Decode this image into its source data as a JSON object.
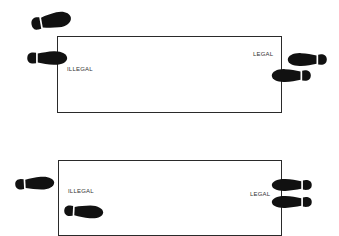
{
  "diagrams": [
    {
      "box": {
        "left": 57,
        "top": 36,
        "width": 225,
        "height": 77
      },
      "labels": {
        "illegal": {
          "text": "ILLEGAL",
          "x": 67,
          "y": 66
        },
        "legal": {
          "text": "LEGAL",
          "x": 253,
          "y": 51
        }
      },
      "feet": [
        {
          "name": "foot-outside-top",
          "x": 30,
          "y": 12,
          "w": 42,
          "h": 18,
          "dir": "right",
          "rotate": -10
        },
        {
          "name": "foot-on-left-line",
          "x": 26,
          "y": 50,
          "w": 42,
          "h": 16,
          "dir": "right",
          "rotate": 0
        },
        {
          "name": "foot-right-upper",
          "x": 287,
          "y": 52,
          "w": 41,
          "h": 15,
          "dir": "left",
          "rotate": 0
        },
        {
          "name": "foot-right-lower-on-line",
          "x": 271,
          "y": 68,
          "w": 41,
          "h": 15,
          "dir": "left",
          "rotate": 0
        }
      ]
    },
    {
      "box": {
        "left": 58,
        "top": 160,
        "width": 224,
        "height": 76
      },
      "labels": {
        "illegal": {
          "text": "ILLEGAL",
          "x": 68,
          "y": 188
        },
        "legal": {
          "text": "LEGAL",
          "x": 250,
          "y": 191
        }
      },
      "feet": [
        {
          "name": "foot-outside-left",
          "x": 14,
          "y": 176,
          "w": 41,
          "h": 15,
          "dir": "right",
          "rotate": -3
        },
        {
          "name": "foot-inside-box",
          "x": 63,
          "y": 204,
          "w": 41,
          "h": 15,
          "dir": "right",
          "rotate": 3
        },
        {
          "name": "foot-right-upper-on-line",
          "x": 271,
          "y": 178,
          "w": 42,
          "h": 14,
          "dir": "left",
          "rotate": 0
        },
        {
          "name": "foot-right-lower-on-line",
          "x": 271,
          "y": 195,
          "w": 42,
          "h": 14,
          "dir": "left",
          "rotate": 0
        }
      ]
    }
  ],
  "colors": {
    "ink": "#111111",
    "line": "#2a2a2a",
    "background": "#ffffff"
  }
}
